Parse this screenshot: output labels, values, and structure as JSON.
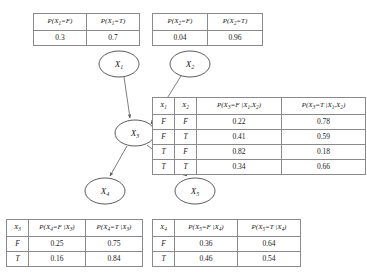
{
  "diagram": {
    "nodes": [
      {
        "id": "X1",
        "label": "X",
        "subscript": "1",
        "cx": 119,
        "cy": 64,
        "rx": 20,
        "ry": 13
      },
      {
        "id": "X2",
        "label": "X",
        "subscript": "2",
        "cx": 190,
        "cy": 64,
        "rx": 20,
        "ry": 13
      },
      {
        "id": "X3",
        "label": "X",
        "subscript": "3",
        "cx": 135,
        "cy": 133,
        "rx": 20,
        "ry": 13
      },
      {
        "id": "X4",
        "label": "X",
        "subscript": "4",
        "cx": 105,
        "cy": 191,
        "rx": 20,
        "ry": 13
      },
      {
        "id": "X5",
        "label": "X",
        "subscript": "5",
        "cx": 195,
        "cy": 191,
        "rx": 20,
        "ry": 13
      }
    ],
    "edges": [
      {
        "from": "X1",
        "to": "X3"
      },
      {
        "from": "X2",
        "to": "X3"
      },
      {
        "from": "X3",
        "to": "X4"
      },
      {
        "from": "X3",
        "to": "X5"
      }
    ],
    "colors": {
      "node_stroke": "#4a4a4a",
      "edge_stroke": "#6e6e6e",
      "table_border": "#8a8a8a",
      "text": "#1a1a1a",
      "background": "#ffffff"
    }
  },
  "tables": {
    "x1_prior": {
      "name": "X1 prior",
      "headers": [
        "P(X₁=F)",
        "P(X₁=T)"
      ],
      "header_parts": [
        {
          "pre": "P(X",
          "sub": "1",
          "post": "=F)"
        },
        {
          "pre": "P(X",
          "sub": "1",
          "post": "=T)"
        }
      ],
      "rows": [
        [
          "0.3",
          "0.7"
        ]
      ]
    },
    "x2_prior": {
      "name": "X2 prior",
      "headers": [
        "P(X₂=F)",
        "P(X₂=T)"
      ],
      "header_parts": [
        {
          "pre": "P(X",
          "sub": "2",
          "post": "=F)"
        },
        {
          "pre": "P(X",
          "sub": "2",
          "post": "=T)"
        }
      ],
      "rows": [
        [
          "0.04",
          "0.96"
        ]
      ]
    },
    "x3_cpt": {
      "name": "X3 conditional probability table",
      "headers": [
        "X₁",
        "X₂",
        "P(X₃=F |X₁,X₂)",
        "P(X₃=T |X₁,X₂)"
      ],
      "header_parts": [
        {
          "pre": "X",
          "sub": "1",
          "post": ""
        },
        {
          "pre": "X",
          "sub": "2",
          "post": ""
        },
        {
          "pre": "P(X",
          "sub": "3",
          "post": "=F |X",
          "sub2": "1",
          "post2": ",X",
          "sub3": "2",
          "post3": ")"
        },
        {
          "pre": "P(X",
          "sub": "3",
          "post": "=T |X",
          "sub2": "1",
          "post2": ",X",
          "sub3": "2",
          "post3": ")"
        }
      ],
      "rows": [
        [
          "F",
          "F",
          "0.22",
          "0.78"
        ],
        [
          "F",
          "T",
          "0.41",
          "0.59"
        ],
        [
          "T",
          "F",
          "0.82",
          "0.18"
        ],
        [
          "T",
          "T",
          "0.34",
          "0.66"
        ]
      ]
    },
    "x4_cpt": {
      "name": "X4 conditional probability table",
      "headers": [
        "X₃",
        "P(X₄=F |X₃)",
        "P(X₄=T |X₃)"
      ],
      "header_parts": [
        {
          "pre": "X",
          "sub": "3",
          "post": ""
        },
        {
          "pre": "P(X",
          "sub": "4",
          "post": "=F |X",
          "sub2": "3",
          "post2": ")"
        },
        {
          "pre": "P(X",
          "sub": "4",
          "post": "=T |X",
          "sub2": "3",
          "post2": ")"
        }
      ],
      "rows": [
        [
          "F",
          "0.25",
          "0.75"
        ],
        [
          "T",
          "0.16",
          "0.84"
        ]
      ]
    },
    "x5_cpt": {
      "name": "X5 conditional probability table",
      "headers": [
        "X₄",
        "P(X₅=F |X₄)",
        "P(X₅=T |X₄)"
      ],
      "header_parts": [
        {
          "pre": "X",
          "sub": "4",
          "post": ""
        },
        {
          "pre": "P(X",
          "sub": "5",
          "post": "=F |X",
          "sub2": "4",
          "post2": ")"
        },
        {
          "pre": "P(X",
          "sub": "5",
          "post": "=T |X",
          "sub2": "4",
          "post2": ")"
        }
      ],
      "rows": [
        [
          "F",
          "0.36",
          "0.64"
        ],
        [
          "T",
          "0.46",
          "0.54"
        ]
      ]
    }
  }
}
